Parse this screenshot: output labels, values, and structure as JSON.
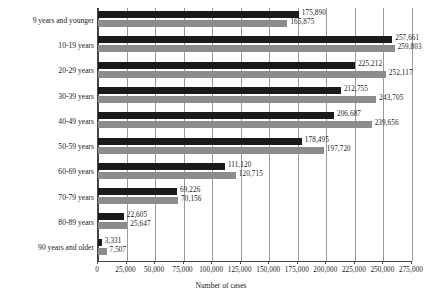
{
  "chart_data": {
    "type": "bar",
    "orientation": "horizontal",
    "title": "",
    "xlabel": "Number of cases",
    "ylabel": "",
    "xlim": [
      0,
      275000
    ],
    "xticks": [
      0,
      25000,
      50000,
      75000,
      100000,
      125000,
      150000,
      175000,
      200000,
      225000,
      250000,
      275000
    ],
    "xticklabels": [
      "0",
      "25,000",
      "50,000",
      "75,000",
      "100,000",
      "125,000",
      "150,000",
      "175,000",
      "200,000",
      "225,000",
      "250,000",
      "275,000"
    ],
    "grid": true,
    "grid_axis": "x",
    "legend": false,
    "categories": [
      "9 years and younger",
      "10-19 years",
      "20-29 years",
      "30-39 years",
      "40-49 years",
      "50-59 years",
      "60-69 years",
      "70-79 years",
      "80-89 years",
      "90 years and older"
    ],
    "series": [
      {
        "name": "series-1",
        "color": "#1a1a1a",
        "values": [
          175890,
          257661,
          225212,
          212755,
          206687,
          178495,
          111120,
          69226,
          22605,
          3331
        ],
        "labels": [
          "175,890",
          "257,661",
          "225,212",
          "212,755",
          "206,687",
          "178,495",
          "111,120",
          "69,226",
          "22,605",
          "3,331"
        ]
      },
      {
        "name": "series-2",
        "color": "#8c8c8c",
        "values": [
          165875,
          259803,
          252117,
          243705,
          239656,
          197720,
          120715,
          70156,
          25647,
          7507
        ],
        "labels": [
          "165,875",
          "259,803",
          "252,117",
          "243,705",
          "239,656",
          "197,720",
          "120,715",
          "70,156",
          "25,647",
          "7,507"
        ]
      }
    ]
  }
}
